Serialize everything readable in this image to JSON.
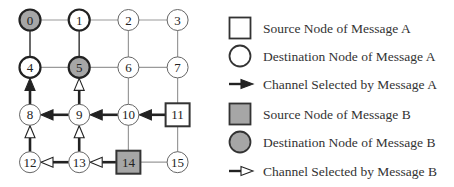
{
  "colors": {
    "grid_line": "#9a9a9a",
    "path_line": "#222222",
    "node_stroke": "#333333",
    "node_fill": "#ffffff",
    "message_b_fill": "#a6a6a6"
  },
  "mesh": {
    "columns": 4,
    "rows": 4,
    "nodes": [
      {
        "id": 0,
        "label": "0",
        "row": 0,
        "col": 0,
        "role": "destination-b"
      },
      {
        "id": 1,
        "label": "1",
        "row": 0,
        "col": 1,
        "role": "destination-a"
      },
      {
        "id": 2,
        "label": "2",
        "row": 0,
        "col": 2,
        "role": "normal"
      },
      {
        "id": 3,
        "label": "3",
        "row": 0,
        "col": 3,
        "role": "normal"
      },
      {
        "id": 4,
        "label": "4",
        "row": 1,
        "col": 0,
        "role": "destination-a"
      },
      {
        "id": 5,
        "label": "5",
        "row": 1,
        "col": 1,
        "role": "destination-b"
      },
      {
        "id": 6,
        "label": "6",
        "row": 1,
        "col": 2,
        "role": "normal"
      },
      {
        "id": 7,
        "label": "7",
        "row": 1,
        "col": 3,
        "role": "normal"
      },
      {
        "id": 8,
        "label": "8",
        "row": 2,
        "col": 0,
        "role": "normal"
      },
      {
        "id": 9,
        "label": "9",
        "row": 2,
        "col": 1,
        "role": "normal"
      },
      {
        "id": 10,
        "label": "10",
        "row": 2,
        "col": 2,
        "role": "normal"
      },
      {
        "id": 11,
        "label": "11",
        "row": 2,
        "col": 3,
        "role": "source-a"
      },
      {
        "id": 12,
        "label": "12",
        "row": 3,
        "col": 0,
        "role": "normal"
      },
      {
        "id": 13,
        "label": "13",
        "row": 3,
        "col": 1,
        "role": "normal"
      },
      {
        "id": 14,
        "label": "14",
        "row": 3,
        "col": 2,
        "role": "source-b"
      },
      {
        "id": 15,
        "label": "15",
        "row": 3,
        "col": 3,
        "role": "normal"
      }
    ],
    "channels": [
      {
        "from": 11,
        "to": 10,
        "message": "A"
      },
      {
        "from": 10,
        "to": 9,
        "message": "A"
      },
      {
        "from": 9,
        "to": 8,
        "message": "A"
      },
      {
        "from": 8,
        "to": 4,
        "message": "A"
      },
      {
        "from": 14,
        "to": 13,
        "message": "B"
      },
      {
        "from": 13,
        "to": 12,
        "message": "B"
      },
      {
        "from": 12,
        "to": 8,
        "message": "B"
      },
      {
        "from": 13,
        "to": 9,
        "message": "B"
      },
      {
        "from": 9,
        "to": 5,
        "message": "B"
      }
    ],
    "bold_links": [
      [
        0,
        4
      ],
      [
        1,
        5
      ]
    ]
  },
  "legend": [
    {
      "symbol": "square-white",
      "label": "Source Node of Message A"
    },
    {
      "symbol": "circle-white",
      "label": "Destination Node of Message A"
    },
    {
      "symbol": "arrow-filled",
      "label": "Channel Selected by Message A"
    },
    {
      "symbol": "square-gray",
      "label": "Source Node of Message B"
    },
    {
      "symbol": "circle-gray",
      "label": "Destination Node of Message B"
    },
    {
      "symbol": "arrow-hollow",
      "label": "Channel Selected by Message B"
    }
  ]
}
